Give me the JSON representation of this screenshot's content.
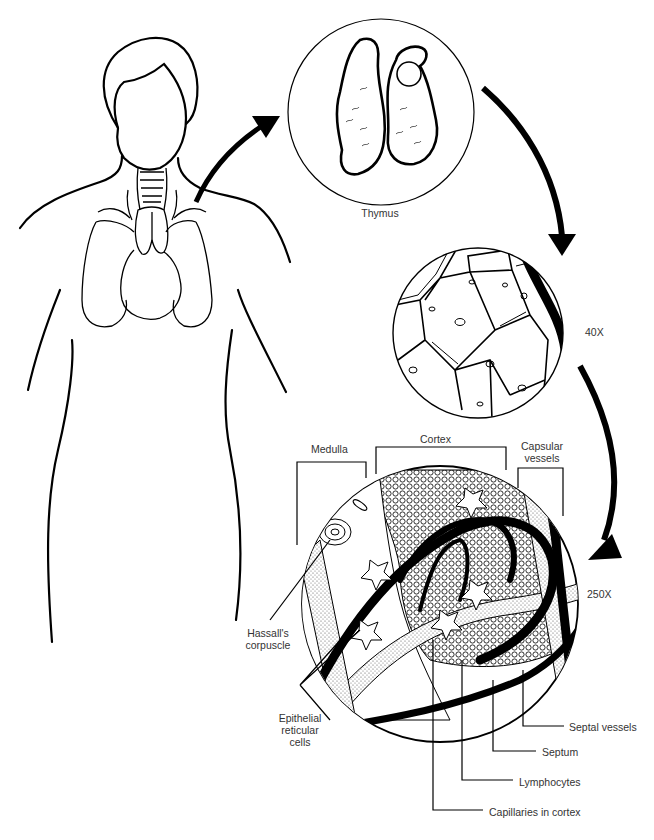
{
  "diagram": {
    "type": "anatomical-magnification-sequence",
    "stages": [
      {
        "id": "body",
        "description": "Human torso outline with thymus above heart"
      },
      {
        "id": "organ",
        "label": "Thymus"
      },
      {
        "id": "low-mag",
        "magnification": "40X"
      },
      {
        "id": "high-mag",
        "magnification": "250X"
      }
    ],
    "labels": {
      "thymus": "Thymus",
      "mag_40": "40X",
      "mag_250": "250X",
      "medulla": "Medulla",
      "cortex": "Cortex",
      "capsular_vessels_line1": "Capsular",
      "capsular_vessels_line2": "vessels",
      "hassalls_line1": "Hassall's",
      "hassalls_line2": "corpuscle",
      "epithelial_line1": "Epithelial",
      "epithelial_line2": "reticular",
      "epithelial_line3": "cells",
      "septal_vessels": "Septal vessels",
      "septum": "Septum",
      "lymphocytes": "Lymphocytes",
      "capillaries": "Capillaries in cortex"
    },
    "colors": {
      "ink": "#000000",
      "label_text": "#333333",
      "background": "#ffffff",
      "stipple": "#bbbbbb"
    }
  }
}
